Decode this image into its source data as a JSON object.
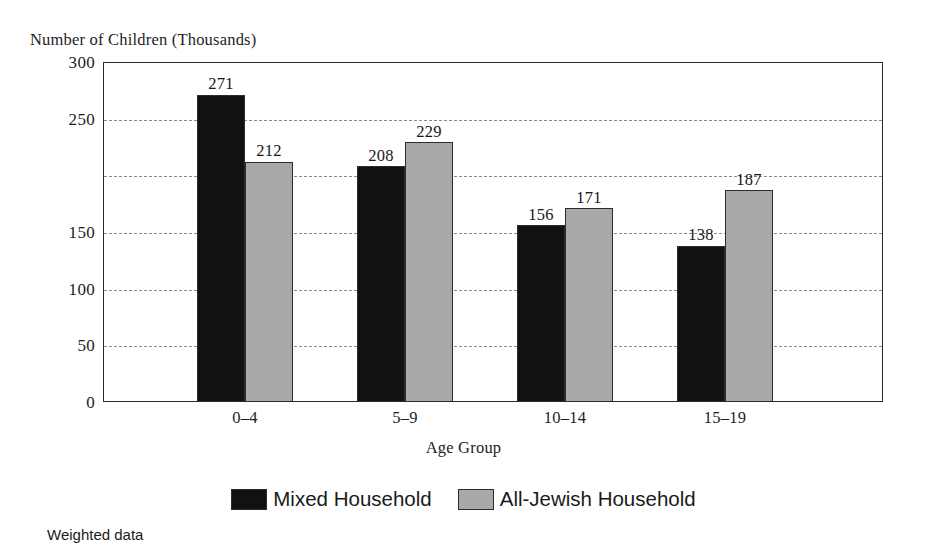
{
  "chart_data": {
    "type": "bar",
    "title": "",
    "ylabel": "Number of Children (Thousands)",
    "xlabel": "Age Group",
    "categories": [
      "0–4",
      "5–9",
      "10–14",
      "15–19"
    ],
    "series": [
      {
        "name": "Mixed Household",
        "color": "#111111",
        "values": [
          271,
          208,
          156,
          138
        ],
        "value_labels": [
          "271",
          "208",
          "156",
          "138"
        ]
      },
      {
        "name": "All-Jewish Household",
        "color": "#a8a8a8",
        "values": [
          212,
          229,
          171,
          187
        ],
        "value_labels": [
          "212",
          "229",
          "171",
          "187"
        ]
      }
    ],
    "ylim": [
      0,
      300
    ],
    "y_ticks": [
      300,
      250,
      200,
      150,
      100,
      50,
      0
    ],
    "y_tick_labels": [
      "300",
      "250",
      "",
      "150",
      "100",
      "50",
      "0"
    ],
    "grid": true,
    "grid_style": "dashed-horizontal",
    "legend_position": "bottom-center"
  },
  "footnote": {
    "text": "Weighted data"
  },
  "colors": {
    "series_mixed": "#111111",
    "series_all_jewish": "#a8a8a8",
    "axis": "#2a2a2a",
    "gridline": "#8a8a8a",
    "text": "#1a1a1a",
    "background": "#ffffff"
  }
}
